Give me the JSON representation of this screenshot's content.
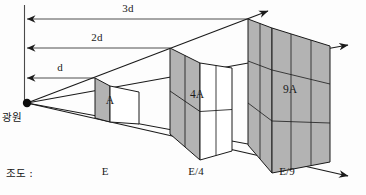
{
  "figure": {
    "title_label": "광원",
    "illuminance_label": "조도 :",
    "source_point_name": "light-source-point",
    "fill_color": "#b3b3b3",
    "line_color": "#1a1a1a",
    "background": "#fdfdfd"
  },
  "distances": [
    {
      "id": "d1",
      "label": "d",
      "value": 1,
      "unit": "d",
      "tick_y": 78,
      "end_x": 95,
      "label_x": 60,
      "label_y": 62
    },
    {
      "id": "d2",
      "label": "2d",
      "value": 2,
      "unit": "d",
      "tick_y": 48,
      "end_x": 170,
      "label_x": 97,
      "label_y": 32
    },
    {
      "id": "d3",
      "label": "3d",
      "value": 3,
      "unit": "d",
      "tick_y": 19,
      "end_x": 248,
      "label_x": 128,
      "label_y": 3
    }
  ],
  "panels": [
    {
      "id": "panel-a",
      "area_label": "A",
      "area_multiplier": 1,
      "grid": 1,
      "distance": "d",
      "label_x": 108,
      "label_y": 95
    },
    {
      "id": "panel-4a",
      "area_label": "4A",
      "area_multiplier": 4,
      "grid": 2,
      "distance": "2d",
      "label_x": 197,
      "label_y": 90
    },
    {
      "id": "panel-9a",
      "area_label": "9A",
      "area_multiplier": 9,
      "grid": 3,
      "distance": "3d",
      "label_x": 290,
      "label_y": 85
    }
  ],
  "illuminance": [
    {
      "id": "illum-e",
      "label": "E",
      "x": 105,
      "y": 168
    },
    {
      "id": "illum-e4",
      "label": "E/4",
      "x": 196,
      "y": 168
    },
    {
      "id": "illum-e9",
      "label": "E/9",
      "x": 287,
      "y": 168
    }
  ],
  "source": {
    "label": "광원",
    "label_x": 2,
    "label_y": 108,
    "x": 26,
    "y": 103
  }
}
